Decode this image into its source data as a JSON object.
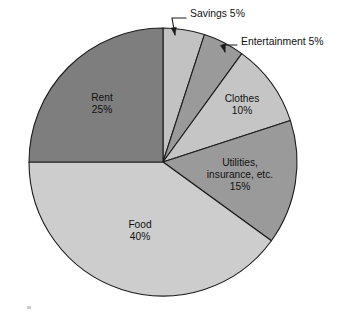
{
  "chart_data": {
    "type": "pie",
    "title": "",
    "subtitle": "",
    "xlabel": "",
    "ylabel": "",
    "legend_position": "none",
    "grid": false,
    "units": "percent",
    "total": 100,
    "start_angle_deg": 0,
    "direction": "clockwise",
    "categories": [
      "Savings",
      "Entertainment",
      "Clothes",
      "Utilities, insurance, etc.",
      "Food",
      "Rent"
    ],
    "values": [
      5,
      5,
      10,
      15,
      40,
      25
    ],
    "slices": [
      {
        "name": "Savings",
        "label_lines": [
          "Savings 5%"
        ],
        "value": 5,
        "percent_text": "5%",
        "color": "#c2c2c2",
        "label_placement": "external",
        "label_x": 190,
        "label_y": 14,
        "leader_from_x": 186,
        "leader_from_y": 18,
        "leader_to_x": 175,
        "leader_to_y": 35
      },
      {
        "name": "Entertainment",
        "label_lines": [
          "Entertainment 5%"
        ],
        "value": 5,
        "percent_text": "5%",
        "color": "#9a9a9a",
        "label_placement": "external",
        "label_x": 241,
        "label_y": 42,
        "leader_from_x": 237,
        "leader_from_y": 45,
        "leader_to_x": 225,
        "leader_to_y": 52
      },
      {
        "name": "Clothes",
        "label_lines": [
          "Clothes",
          "10%"
        ],
        "value": 10,
        "percent_text": "10%",
        "color": "#c5c5c5",
        "label_placement": "internal",
        "label_x": 242,
        "label_y": 105
      },
      {
        "name": "Utilities, insurance, etc.",
        "label_lines": [
          "Utilities,",
          "insurance, etc.",
          "15%"
        ],
        "value": 15,
        "percent_text": "15%",
        "color": "#9a9a9a",
        "label_placement": "internal",
        "label_x": 240,
        "label_y": 175
      },
      {
        "name": "Food",
        "label_lines": [
          "Food",
          "40%"
        ],
        "value": 40,
        "percent_text": "40%",
        "color": "#cdcdcd",
        "label_placement": "internal",
        "label_x": 140,
        "label_y": 231
      },
      {
        "name": "Rent",
        "label_lines": [
          "Rent",
          "25%"
        ],
        "value": 25,
        "percent_text": "25%",
        "color": "#7e7e7e",
        "label_placement": "internal",
        "label_x": 102,
        "label_y": 104
      }
    ],
    "geometry": {
      "center_x": 163,
      "center_y": 162,
      "radius": 134
    }
  }
}
